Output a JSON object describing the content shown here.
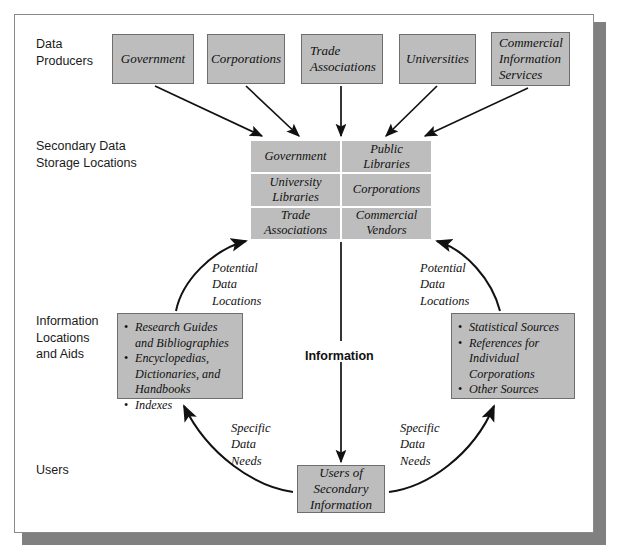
{
  "diagram": {
    "colors": {
      "node_fill": "#bdbdbd",
      "node_border": "#6e6e6e",
      "frame_border": "#8a8a8a",
      "frame_shadow": "#808080",
      "arrow": "#111111",
      "text": "#111111"
    },
    "row_labels": [
      {
        "id": "data-producers",
        "text": "Data\nProducers"
      },
      {
        "id": "secondary-data-storage",
        "text": "Secondary Data\nStorage Locations"
      },
      {
        "id": "information-locations",
        "text": "Information\nLocations\nand Aids"
      },
      {
        "id": "users",
        "text": "Users"
      }
    ],
    "producers": [
      {
        "id": "government",
        "label": "Government"
      },
      {
        "id": "corporations",
        "label": "Corporations"
      },
      {
        "id": "trade-associations",
        "label": "Trade\nAssociations"
      },
      {
        "id": "universities",
        "label": "Universities"
      },
      {
        "id": "commercial-information-services",
        "label": "Commercial\nInformation\nServices"
      }
    ],
    "storage_grid": [
      {
        "id": "storage-government",
        "label": "Government"
      },
      {
        "id": "storage-public-libraries",
        "label": "Public\nLibraries"
      },
      {
        "id": "storage-university-libraries",
        "label": "University\nLibraries"
      },
      {
        "id": "storage-corporations",
        "label": "Corporations"
      },
      {
        "id": "storage-trade-associations",
        "label": "Trade\nAssociations"
      },
      {
        "id": "storage-commercial-vendors",
        "label": "Commercial\nVendors"
      }
    ],
    "info_box_left": {
      "id": "information-aids-left",
      "items": [
        "Research Guides\nand Bibliographies",
        "Encyclopedias,\nDictionaries, and\nHandbooks",
        "Indexes"
      ]
    },
    "info_box_right": {
      "id": "information-aids-right",
      "items": [
        "Statistical Sources",
        "References for\nIndividual\nCorporations",
        "Other Sources"
      ]
    },
    "users_node": {
      "id": "users-of-secondary-information",
      "label": "Users of\nSecondary\nInformation"
    },
    "annotations": [
      {
        "id": "potential-data-locations-left",
        "text": "Potential\nData\nLocations"
      },
      {
        "id": "potential-data-locations-right",
        "text": "Potential\nData\nLocations"
      },
      {
        "id": "information-flow-label",
        "text": "Information"
      },
      {
        "id": "specific-data-needs-left",
        "text": "Specific\nData\nNeeds"
      },
      {
        "id": "specific-data-needs-right",
        "text": "Specific\nData\nNeeds"
      }
    ]
  }
}
